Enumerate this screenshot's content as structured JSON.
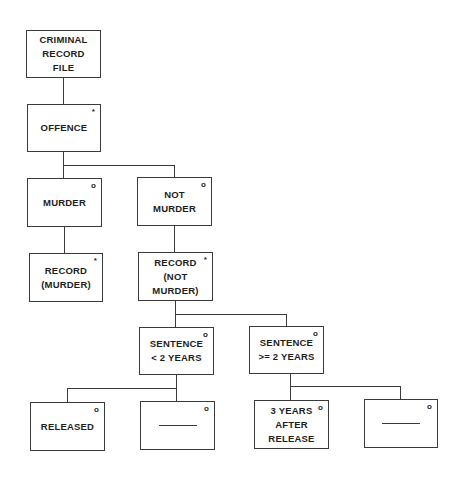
{
  "diagram": {
    "type": "jackson-structure-diagram",
    "nodes": [
      {
        "id": "criminal-record-file",
        "label": "CRIMINAL\nRECORD\nFILE",
        "marker": ""
      },
      {
        "id": "offence",
        "label": "OFFENCE",
        "marker": "*"
      },
      {
        "id": "murder",
        "label": "MURDER",
        "marker": "o"
      },
      {
        "id": "not-murder",
        "label": "NOT\nMURDER",
        "marker": "o"
      },
      {
        "id": "record-murder",
        "label": "RECORD\n(MURDER)",
        "marker": "*"
      },
      {
        "id": "record-not-murder",
        "label": "RECORD\n(NOT  MURDER)",
        "marker": "*"
      },
      {
        "id": "sentence-lt-2",
        "label": "SENTENCE\n< 2 YEARS",
        "marker": "o"
      },
      {
        "id": "sentence-ge-2",
        "label": "SENTENCE\n>= 2 YEARS",
        "marker": "o"
      },
      {
        "id": "released",
        "label": "RELEASED",
        "marker": "o"
      },
      {
        "id": "blank-1",
        "label": "",
        "marker": "o",
        "blank": true
      },
      {
        "id": "three-years-after-release",
        "label": "3 YEARS\nAFTER\nRELEASE",
        "marker": "o"
      },
      {
        "id": "blank-2",
        "label": "",
        "marker": "o",
        "blank": true
      }
    ],
    "edges": [
      [
        "criminal-record-file",
        "offence"
      ],
      [
        "offence",
        "murder"
      ],
      [
        "offence",
        "not-murder"
      ],
      [
        "murder",
        "record-murder"
      ],
      [
        "not-murder",
        "record-not-murder"
      ],
      [
        "record-not-murder",
        "sentence-lt-2"
      ],
      [
        "record-not-murder",
        "sentence-ge-2"
      ],
      [
        "sentence-lt-2",
        "released"
      ],
      [
        "sentence-lt-2",
        "blank-1"
      ],
      [
        "sentence-ge-2",
        "three-years-after-release"
      ],
      [
        "sentence-ge-2",
        "blank-2"
      ]
    ]
  }
}
